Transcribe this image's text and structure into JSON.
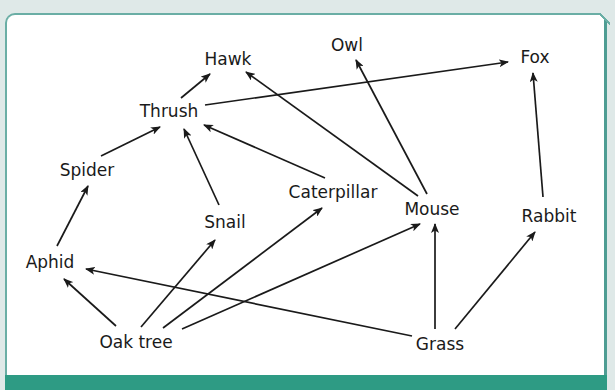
{
  "diagram": {
    "colors": {
      "background": "#dfe9e8",
      "panel": "#ffffff",
      "border": "#6aaea5",
      "bottom_bar": "#2e9b84",
      "ink": "#1a1a1a"
    },
    "nodes": [
      {
        "id": "hawk",
        "label": "Hawk",
        "x": 228,
        "y": 60
      },
      {
        "id": "owl",
        "label": "Owl",
        "x": 347,
        "y": 46
      },
      {
        "id": "fox",
        "label": "Fox",
        "x": 535,
        "y": 58
      },
      {
        "id": "thrush",
        "label": "Thrush",
        "x": 169,
        "y": 112
      },
      {
        "id": "spider",
        "label": "Spider",
        "x": 87,
        "y": 171
      },
      {
        "id": "caterpillar",
        "label": "Caterpillar",
        "x": 333,
        "y": 193
      },
      {
        "id": "snail",
        "label": "Snail",
        "x": 225,
        "y": 223
      },
      {
        "id": "mouse",
        "label": "Mouse",
        "x": 432,
        "y": 210
      },
      {
        "id": "rabbit",
        "label": "Rabbit",
        "x": 549,
        "y": 217
      },
      {
        "id": "aphid",
        "label": "Aphid",
        "x": 50,
        "y": 263
      },
      {
        "id": "oak_tree",
        "label": "Oak tree",
        "x": 136,
        "y": 343
      },
      {
        "id": "grass",
        "label": "Grass",
        "x": 440,
        "y": 345
      }
    ],
    "edges": [
      {
        "from": "thrush",
        "to": "hawk",
        "x1": 181,
        "y1": 98,
        "x2": 210,
        "y2": 74
      },
      {
        "from": "mouse",
        "to": "hawk",
        "x1": 418,
        "y1": 196,
        "x2": 246,
        "y2": 72
      },
      {
        "from": "thrush",
        "to": "fox",
        "x1": 205,
        "y1": 105,
        "x2": 508,
        "y2": 62
      },
      {
        "from": "mouse",
        "to": "owl",
        "x1": 427,
        "y1": 194,
        "x2": 356,
        "y2": 60
      },
      {
        "from": "rabbit",
        "to": "fox",
        "x1": 543,
        "y1": 197,
        "x2": 533,
        "y2": 73
      },
      {
        "from": "spider",
        "to": "thrush",
        "x1": 101,
        "y1": 156,
        "x2": 160,
        "y2": 127
      },
      {
        "from": "snail",
        "to": "thrush",
        "x1": 219,
        "y1": 205,
        "x2": 184,
        "y2": 129
      },
      {
        "from": "caterpillar",
        "to": "thrush",
        "x1": 325,
        "y1": 178,
        "x2": 204,
        "y2": 125
      },
      {
        "from": "aphid",
        "to": "spider",
        "x1": 57,
        "y1": 246,
        "x2": 88,
        "y2": 186
      },
      {
        "from": "oak_tree",
        "to": "aphid",
        "x1": 116,
        "y1": 326,
        "x2": 64,
        "y2": 279
      },
      {
        "from": "grass",
        "to": "aphid",
        "x1": 412,
        "y1": 336,
        "x2": 86,
        "y2": 269
      },
      {
        "from": "oak_tree",
        "to": "snail",
        "x1": 141,
        "y1": 327,
        "x2": 215,
        "y2": 240
      },
      {
        "from": "oak_tree",
        "to": "caterpillar",
        "x1": 163,
        "y1": 328,
        "x2": 322,
        "y2": 208
      },
      {
        "from": "oak_tree",
        "to": "mouse",
        "x1": 182,
        "y1": 329,
        "x2": 420,
        "y2": 224
      },
      {
        "from": "grass",
        "to": "mouse",
        "x1": 435,
        "y1": 329,
        "x2": 435,
        "y2": 224
      },
      {
        "from": "grass",
        "to": "rabbit",
        "x1": 455,
        "y1": 329,
        "x2": 535,
        "y2": 232
      }
    ]
  }
}
